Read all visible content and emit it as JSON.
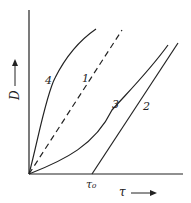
{
  "diagram": {
    "y_axis_label": "D",
    "x_axis_label": "τ",
    "x_tick_label": "τ₀",
    "curves": [
      {
        "id": "1",
        "label": "1",
        "style": "dashed",
        "description": "straight line through origin"
      },
      {
        "id": "2",
        "label": "2",
        "style": "solid",
        "description": "straight line starting at τ₀"
      },
      {
        "id": "3",
        "label": "3",
        "style": "solid",
        "description": "convex curve from origin"
      },
      {
        "id": "4",
        "label": "4",
        "style": "solid",
        "description": "concave curve from origin"
      }
    ],
    "colors": {
      "line": "#222222",
      "background": "#ffffff"
    }
  }
}
